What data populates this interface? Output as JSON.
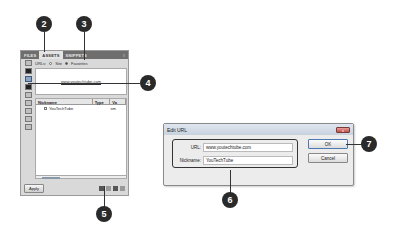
{
  "assets_panel": {
    "tabs": [
      {
        "label": "FILES",
        "active": false
      },
      {
        "label": "ASSETS",
        "active": true
      },
      {
        "label": "SNIPPETS",
        "active": false
      }
    ],
    "menu_icon": "panel-menu-icon",
    "view_label": "URLs:",
    "view_options": [
      {
        "label": "Site",
        "selected": false
      },
      {
        "label": "Favorites",
        "selected": true
      }
    ],
    "preview_text": "www.youtechtube.com",
    "side_icons": [
      "images-icon",
      "colors-icon",
      "urls-icon",
      "flash-icon",
      "shockwave-icon",
      "movies-icon",
      "scripts-icon",
      "templates-icon",
      "library-icon"
    ],
    "columns": [
      "Nickname",
      "Type",
      "Va"
    ],
    "rows": [
      {
        "nickname": "YouTechTube",
        "type": "",
        "value": "sm"
      }
    ],
    "apply_label": "Apply",
    "bottom_icons": [
      "new-favorite-folder-icon",
      "edit-icon",
      "new-asset-icon",
      "remove-from-favorites-icon"
    ]
  },
  "dialog": {
    "title": "Edit URL",
    "close_label": "x",
    "url_label": "URL:",
    "url_value": "www.youtechtube.com",
    "nickname_label": "Nickname:",
    "nickname_value": "YouTechTube",
    "ok_label": "OK",
    "cancel_label": "Cancel"
  },
  "callouts": [
    "2",
    "3",
    "4",
    "5",
    "6",
    "7"
  ]
}
